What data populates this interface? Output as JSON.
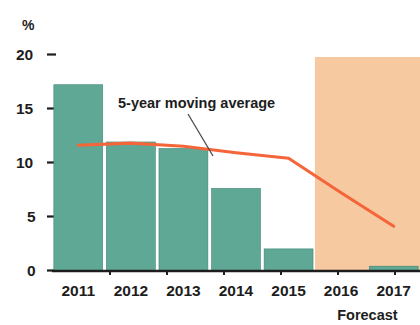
{
  "chart_data": {
    "type": "bar",
    "title": "",
    "subtitle": "",
    "xlabel": "",
    "ylabel": "%",
    "ylim": [
      0,
      20
    ],
    "yticks": [
      0,
      5,
      10,
      15,
      20
    ],
    "ytick_labels": [
      "0",
      "5",
      "10",
      "15",
      "20"
    ],
    "grid": false,
    "legend": "none",
    "categories": [
      "2011",
      "2012",
      "2013",
      "2014",
      "2015",
      "2016",
      "2017"
    ],
    "series": [
      {
        "name": "Annual value",
        "type": "bar",
        "color": "#5fa896",
        "values": [
          17.2,
          11.9,
          11.3,
          7.6,
          2.0,
          0.0,
          0.4
        ]
      },
      {
        "name": "5-year moving average",
        "type": "line",
        "color": "#f4663a",
        "x": [
          "2011",
          "2012",
          "2013",
          "2014",
          "2015",
          "2016",
          "2017"
        ],
        "values": [
          11.6,
          11.8,
          11.5,
          10.9,
          10.4,
          7.2,
          4.1
        ]
      }
    ],
    "annotations": [
      {
        "name": "moving-average-callout",
        "text": "5-year moving average",
        "x": 118,
        "y": 107,
        "leader_from": [
          186,
          114
        ],
        "leader_to": [
          212,
          155
        ]
      },
      {
        "name": "forecast-caption",
        "text": "Forecast",
        "x": 362,
        "y": 317
      }
    ],
    "shaded_regions": [
      {
        "name": "forecast-band",
        "label": "Forecast",
        "from_category": "2016",
        "to_category": "2017",
        "color": "#f6c9a0",
        "x": 303,
        "y": 57,
        "width": 117,
        "height": 214
      }
    ],
    "axis_unit": "%"
  }
}
